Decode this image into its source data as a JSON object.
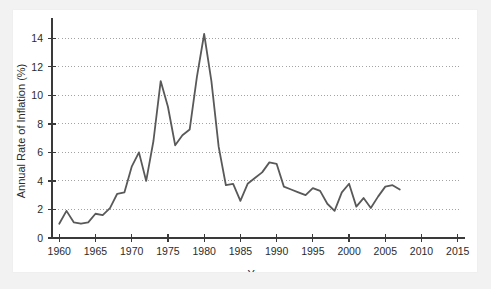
{
  "figure": {
    "background_color": "#f2f2f3",
    "panel_color": "#ffffff",
    "line_color": "#595959",
    "axis_color": "#3a3a3a",
    "grid_color": "#8c8c8c",
    "text_color": "#2b2b2b"
  },
  "chart_data": {
    "type": "line",
    "title": "",
    "xlabel": "Year",
    "ylabel": "Annual Rate of Inflation (%)",
    "xlim": [
      1959,
      2016
    ],
    "ylim": [
      0,
      15
    ],
    "xticks": [
      1960,
      1965,
      1970,
      1975,
      1980,
      1985,
      1990,
      1995,
      2000,
      2005,
      2010,
      2015
    ],
    "xtick_labels": [
      "1960",
      "1965",
      "1970",
      "1975",
      "1980",
      "1985",
      "1990",
      "1995",
      "2000",
      "2005",
      "2010",
      "2015"
    ],
    "yticks": [
      0,
      2,
      4,
      6,
      8,
      10,
      12,
      14
    ],
    "ytick_labels": [
      "0",
      "2",
      "4",
      "6",
      "8",
      "10",
      "12",
      "14"
    ],
    "grid": true,
    "grid_axis": "y",
    "grid_style": "dotted",
    "legend": false,
    "series": [
      {
        "name": "Annual Rate of Inflation",
        "x": [
          1960,
          1961,
          1962,
          1963,
          1964,
          1965,
          1966,
          1967,
          1968,
          1969,
          1970,
          1971,
          1972,
          1973,
          1974,
          1975,
          1976,
          1977,
          1978,
          1979,
          1980,
          1981,
          1982,
          1983,
          1984,
          1985,
          1986,
          1987,
          1988,
          1989,
          1990,
          1991,
          1992,
          1993,
          1994,
          1995,
          1996,
          1997,
          1998,
          1999,
          2000,
          2001,
          2002,
          2003,
          2004,
          2005,
          2006,
          2007
        ],
        "values": [
          1.0,
          1.9,
          1.1,
          1.0,
          1.1,
          1.7,
          1.6,
          2.1,
          3.1,
          3.2,
          5.0,
          6.0,
          4.0,
          6.8,
          11.0,
          9.2,
          6.5,
          7.2,
          7.6,
          11.3,
          14.3,
          11.0,
          6.4,
          3.7,
          3.8,
          2.6,
          3.8,
          4.2,
          4.6,
          5.3,
          5.2,
          3.6,
          3.4,
          3.2,
          3.0,
          3.5,
          3.3,
          2.4,
          1.9,
          3.2,
          3.8,
          2.2,
          2.8,
          2.1,
          2.9,
          3.6,
          3.7,
          3.4
        ],
        "color": "#595959",
        "linewidth": 1.8
      }
    ]
  }
}
